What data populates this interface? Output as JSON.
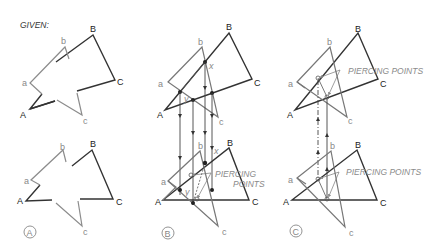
{
  "title": "GIVEN:",
  "panels": [
    {
      "id": "A",
      "circle_label": "A",
      "top_labels": {
        "A": "A",
        "B": "B",
        "C": "C",
        "a": "a",
        "b": "b",
        "c": "c"
      },
      "bottom_labels": {
        "A": "A",
        "B": "B",
        "C": "C",
        "a": "a",
        "b": "b",
        "c": "c"
      }
    },
    {
      "id": "B",
      "circle_label": "B",
      "top_labels": {
        "A": "A",
        "B": "B",
        "C": "C",
        "a": "a",
        "b": "b",
        "c": "c",
        "x": "x",
        "y": "y"
      },
      "bottom_labels": {
        "A": "A",
        "B": "B",
        "C": "C",
        "a": "a",
        "b": "b",
        "c": "c",
        "x": "x",
        "y": "y"
      },
      "annotation_line1": "PIERCING",
      "annotation_line2": "POINTS"
    },
    {
      "id": "C",
      "circle_label": "C",
      "top_labels": {
        "A": "A",
        "B": "B",
        "C": "C",
        "a": "a",
        "b": "b",
        "c": "c"
      },
      "bottom_labels": {
        "A": "A",
        "B": "B",
        "C": "C",
        "a": "a",
        "b": "b",
        "c": "c"
      },
      "annotation_top": "PIERCING POINTS",
      "annotation_bottom": "PIERCING POINTS"
    }
  ],
  "colors": {
    "dark_plane": "#333333",
    "light_plane": "#8c8c8c",
    "projection": "#555555"
  }
}
